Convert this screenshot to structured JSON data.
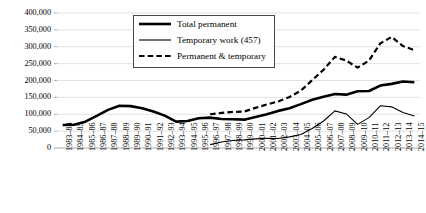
{
  "chart_data": {
    "type": "line",
    "title": "",
    "xlabel": "",
    "ylabel": "",
    "ylim": [
      0,
      400000
    ],
    "ytick_step": 50000,
    "grid": "horizontal",
    "legend_position": "upper-center-left inside plot",
    "ytick_labels": [
      "0",
      "50,000",
      "100,000",
      "150,000",
      "200,000",
      "250,000",
      "300,000",
      "350,000",
      "400,000"
    ],
    "ytick_values": [
      0,
      50000,
      100000,
      150000,
      200000,
      250000,
      300000,
      350000,
      400000
    ],
    "categories": [
      "1983–84",
      "1984–85",
      "1985–86",
      "1986–87",
      "1987–88",
      "1988–89",
      "1989–90",
      "1990–91",
      "1991–92",
      "1992–93",
      "1993–94",
      "1994–95",
      "1995–96",
      "1996–97",
      "1997–98",
      "1998–99",
      "1999–00",
      "2000–01",
      "2001–02",
      "2002–03",
      "2003–04",
      "2004–05",
      "2005–06",
      "2006–07",
      "2007–08",
      "2008–09",
      "2009–10",
      "2010–11",
      "2011–12",
      "2012–13",
      "2013–14",
      "2014–15"
    ],
    "series": [
      {
        "name": "Total permanent",
        "style": "thick-solid",
        "color": "#000000",
        "values": [
          68000,
          69000,
          78000,
          95000,
          113000,
          125000,
          124000,
          118000,
          108000,
          96000,
          78000,
          80000,
          88000,
          90000,
          86000,
          85000,
          84000,
          92000,
          100000,
          110000,
          118000,
          130000,
          143000,
          152000,
          160000,
          158000,
          168000,
          169000,
          185000,
          190000,
          197000,
          195000
        ]
      },
      {
        "name": "Temporary work (457)",
        "style": "thin-solid",
        "color": "#000000",
        "values": [
          null,
          null,
          null,
          null,
          null,
          null,
          null,
          null,
          null,
          null,
          null,
          null,
          null,
          10000,
          18000,
          22000,
          24000,
          27000,
          29000,
          28000,
          33000,
          40000,
          58000,
          80000,
          110000,
          101000,
          70000,
          90000,
          125000,
          122000,
          105000,
          95000
        ]
      },
      {
        "name": "Permanent & temporary",
        "style": "dashed",
        "color": "#000000",
        "values": [
          null,
          null,
          null,
          null,
          null,
          null,
          null,
          null,
          null,
          null,
          null,
          null,
          null,
          100000,
          104000,
          107000,
          108000,
          119000,
          129000,
          138000,
          151000,
          170000,
          201000,
          232000,
          270000,
          259000,
          238000,
          259000,
          310000,
          329000,
          302000,
          290000
        ]
      }
    ]
  },
  "legend": {
    "items": [
      {
        "label": "Total permanent",
        "key": "thick-solid"
      },
      {
        "label": "Temporary work (457)",
        "key": "thin-solid"
      },
      {
        "label": "Permanent & temporary",
        "key": "dashed"
      }
    ]
  }
}
